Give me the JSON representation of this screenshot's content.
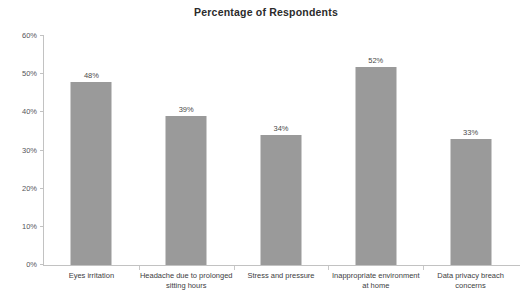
{
  "chart_data": {
    "type": "bar",
    "title": "Percentage of Respondents",
    "xlabel": "",
    "ylabel": "",
    "ylim": [
      0,
      60
    ],
    "ytick_step": 10,
    "ytick_labels": [
      "0%",
      "10%",
      "20%",
      "30%",
      "40%",
      "50%",
      "60%"
    ],
    "ytick_values": [
      0,
      10,
      20,
      30,
      40,
      50,
      60
    ],
    "grid": false,
    "legend": false,
    "value_suffix": "%",
    "bar_color": "#9a9a9a",
    "axis_color": "#c2c2c2",
    "categories": [
      "Eyes irritation",
      "Headache due to prolonged\nsitting hours",
      "Stress and pressure",
      "Inappropriate environment\nat home",
      "Data privacy breach concerns"
    ],
    "values": [
      48,
      39,
      34,
      52,
      33
    ],
    "value_labels": [
      "48%",
      "39%",
      "34%",
      "52%",
      "33%"
    ]
  }
}
